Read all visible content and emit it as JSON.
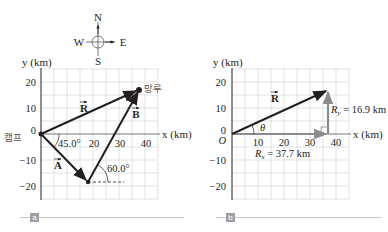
{
  "compass": {
    "north": "N",
    "south": "S",
    "east": "E",
    "west": "W"
  },
  "panel_a": {
    "tag": "a",
    "y_axis_label": "y (km)",
    "x_axis_label": "x (km)",
    "y_ticks": [
      "20",
      "10",
      "0",
      "−10",
      "−20"
    ],
    "x_ticks": [
      "20",
      "30",
      "40"
    ],
    "camp_label": "캠프",
    "tower_label": "망루",
    "vector_R": "R",
    "vector_A": "A",
    "vector_B": "B",
    "angle_A": "45.0°",
    "angle_B": "60.0°"
  },
  "panel_b": {
    "tag": "b",
    "y_axis_label": "y (km)",
    "x_axis_label": "x (km)",
    "y_ticks": [
      "20",
      "10",
      "0",
      "−10",
      "−20"
    ],
    "x_ticks": [
      "10",
      "20",
      "30",
      "40"
    ],
    "origin_label": "O",
    "vector_R": "R",
    "theta": "θ",
    "Ry_label": "R",
    "Ry_sub": "y",
    "Ry_value": " = 16.9 km",
    "Rx_label": "R",
    "Rx_sub": "x",
    "Rx_value": " = 37.7 km"
  },
  "colors": {
    "vector": "#231f20",
    "component": "#8a8c8e",
    "grid": "#d9dadb",
    "axis": "#231f20",
    "tag_bg": "#9d9fa2"
  }
}
